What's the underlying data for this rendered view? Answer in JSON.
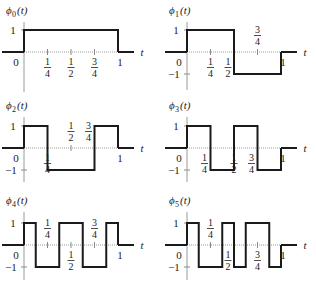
{
  "figure": {
    "axis_variable": "t",
    "y_levels": [
      "1",
      "−1"
    ],
    "origin_label": "0",
    "end_label": "1",
    "fractions": {
      "quarter": {
        "num": "1",
        "den": "4"
      },
      "half": {
        "num": "1",
        "den": "2"
      },
      "three_quarter": {
        "num": "3",
        "den": "4"
      }
    }
  },
  "panels": [
    {
      "id": "phi0",
      "symbol": "ϕ",
      "index": "0",
      "arg": "(t)",
      "label": "ϕ0(t)"
    },
    {
      "id": "phi1",
      "symbol": "ϕ",
      "index": "1",
      "arg": "(t)",
      "label": "ϕ1(t)"
    },
    {
      "id": "phi2",
      "symbol": "ϕ",
      "index": "2",
      "arg": "(t)",
      "label": "ϕ2(t)"
    },
    {
      "id": "phi3",
      "symbol": "ϕ",
      "index": "3",
      "arg": "(t)",
      "label": "ϕ3(t)"
    },
    {
      "id": "phi4",
      "symbol": "ϕ",
      "index": "4",
      "arg": "(t)",
      "label": "ϕ4(t)"
    },
    {
      "id": "phi5",
      "symbol": "ϕ",
      "index": "5",
      "arg": "(t)",
      "label": "ϕ5(t)"
    }
  ],
  "chart_data": [
    {
      "type": "line",
      "title": "ϕ0(t)",
      "xlabel": "t",
      "step": true,
      "x": [
        0,
        1
      ],
      "values": [
        1
      ],
      "ylim": [
        -1,
        1
      ]
    },
    {
      "type": "line",
      "title": "ϕ1(t)",
      "xlabel": "t",
      "step": true,
      "x": [
        0,
        0.5,
        1
      ],
      "values": [
        1,
        -1
      ],
      "ylim": [
        -1,
        1
      ]
    },
    {
      "type": "line",
      "title": "ϕ2(t)",
      "xlabel": "t",
      "step": true,
      "x": [
        0,
        0.25,
        0.75,
        1
      ],
      "values": [
        1,
        -1,
        1
      ],
      "ylim": [
        -1,
        1
      ]
    },
    {
      "type": "line",
      "title": "ϕ3(t)",
      "xlabel": "t",
      "step": true,
      "x": [
        0,
        0.25,
        0.5,
        0.75,
        1
      ],
      "values": [
        1,
        -1,
        1,
        -1
      ],
      "ylim": [
        -1,
        1
      ]
    },
    {
      "type": "line",
      "title": "ϕ4(t)",
      "xlabel": "t",
      "step": true,
      "x": [
        0,
        0.125,
        0.375,
        0.625,
        0.875,
        1
      ],
      "values": [
        1,
        -1,
        1,
        -1,
        1
      ],
      "ylim": [
        -1,
        1
      ]
    },
    {
      "type": "line",
      "title": "ϕ5(t)",
      "xlabel": "t",
      "step": true,
      "x": [
        0,
        0.125,
        0.375,
        0.5,
        0.625,
        0.875,
        1
      ],
      "values": [
        1,
        -1,
        1,
        -1,
        1,
        -1
      ],
      "ylim": [
        -1,
        1
      ]
    }
  ]
}
